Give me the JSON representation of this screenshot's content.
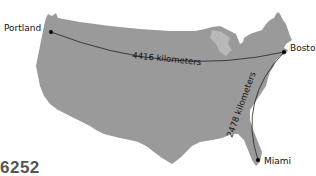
{
  "map": {
    "land_color": "#9a9a9a",
    "route_color": "#222222",
    "cities": [
      {
        "name": "Portland",
        "x": 45,
        "y": 31
      },
      {
        "name": "Bosto",
        "x": 284,
        "y": 52
      },
      {
        "name": "Miami",
        "x": 258,
        "y": 161
      }
    ],
    "routes": [
      {
        "from": "Portland",
        "to": "Boston",
        "label": "4416 kilometers"
      },
      {
        "from": "Boston",
        "to": "Miami",
        "label": "2478 kilometers"
      }
    ]
  },
  "caption": "6252"
}
